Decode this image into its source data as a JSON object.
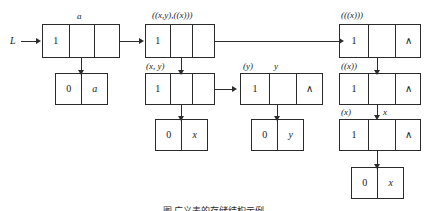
{
  "figure": {
    "type": "generalized-list-linked-storage-diagram",
    "head_pointer_label": "L",
    "nil_glyph": "∧",
    "caption": "图   广义表的存储结构示例",
    "ink_color": "#2b2b2b",
    "background": "#ffffff"
  },
  "nodes": [
    {
      "id": "n1",
      "kind": "head",
      "label": "a",
      "cells": [
        "1",
        "",
        ""
      ]
    },
    {
      "id": "n2",
      "kind": "atom",
      "label": "",
      "cells": [
        "0",
        "a"
      ]
    },
    {
      "id": "n3",
      "kind": "head",
      "label": "((x,y),((x)))",
      "cells": [
        "1",
        "",
        ""
      ]
    },
    {
      "id": "n4",
      "kind": "head",
      "label": "(x, y)",
      "cells": [
        "1",
        "",
        ""
      ]
    },
    {
      "id": "n5",
      "kind": "atom",
      "label": "",
      "cells": [
        "0",
        "x"
      ]
    },
    {
      "id": "n6",
      "kind": "head",
      "label": "(y)",
      "label2": "y",
      "cells": [
        "1",
        "",
        "∧"
      ]
    },
    {
      "id": "n7",
      "kind": "atom",
      "label": "",
      "cells": [
        "0",
        "y"
      ]
    },
    {
      "id": "n8",
      "kind": "head",
      "label": "(((x)))",
      "cells": [
        "1",
        "",
        "∧"
      ]
    },
    {
      "id": "n9",
      "kind": "head",
      "label": "((x))",
      "cells": [
        "1",
        "",
        "∧"
      ]
    },
    {
      "id": "n10",
      "kind": "head",
      "label": "(x)",
      "label2": "x",
      "cells": [
        "1",
        "",
        "∧"
      ]
    },
    {
      "id": "n11",
      "kind": "atom",
      "label": "",
      "cells": [
        "0",
        "x"
      ]
    }
  ]
}
